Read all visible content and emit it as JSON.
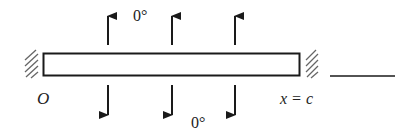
{
  "diagram": {
    "bar": {
      "x_start_label": "O",
      "x_end_label": "x = c"
    },
    "top_boundary_label": "0°",
    "bottom_boundary_label": "0°",
    "arrows_up_count": 3,
    "arrows_down_count": 3,
    "answer_blank": "",
    "colors": {
      "stroke": "#1a1a1a",
      "hatch": "#555555",
      "background": "#ffffff"
    }
  }
}
